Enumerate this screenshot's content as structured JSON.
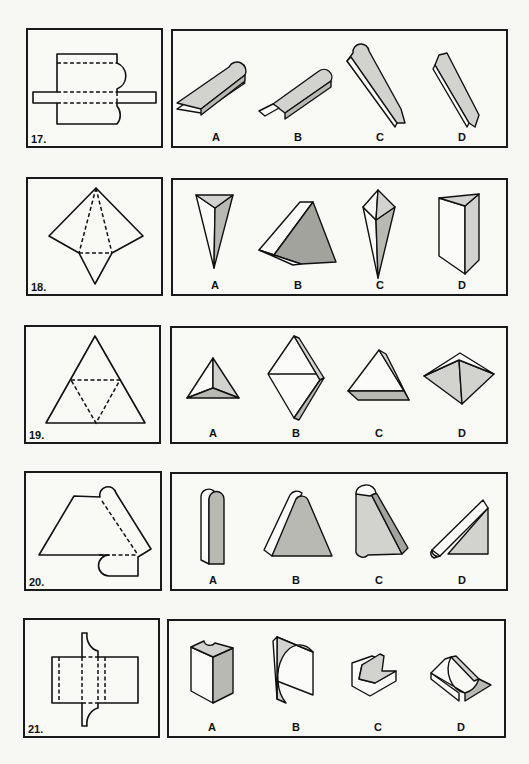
{
  "page": {
    "background": "#f7f7f4",
    "line_color": "#111111",
    "shade_light": "#d2d2ce",
    "shade_dark": "#a3a39e"
  },
  "problems": [
    {
      "number": "17.",
      "net": "rectangle with crossbar tab and two rounded lobes, dashed fold lines",
      "options": [
        {
          "label": "A",
          "shape": "flat bar with rounded end"
        },
        {
          "label": "B",
          "shape": "flat bar with rounded end and small square tab"
        },
        {
          "label": "C",
          "shape": "tall bar with rounded top and square tab at bottom"
        },
        {
          "label": "D",
          "shape": "narrow bar with notched ends"
        }
      ]
    },
    {
      "number": "18.",
      "net": "diamond net with dashed triangle fold lines",
      "options": [
        {
          "label": "A",
          "shape": "inverted triangular pyramid"
        },
        {
          "label": "B",
          "shape": "wedge pyramid"
        },
        {
          "label": "C",
          "shape": "elongated double pyramid"
        },
        {
          "label": "D",
          "shape": "triangular prism"
        }
      ]
    },
    {
      "number": "19.",
      "net": "large triangle with inner dashed triangle",
      "options": [
        {
          "label": "A",
          "shape": "tetrahedron"
        },
        {
          "label": "B",
          "shape": "rhombus slab"
        },
        {
          "label": "C",
          "shape": "triangular slab"
        },
        {
          "label": "D",
          "shape": "flat square pyramid"
        }
      ]
    },
    {
      "number": "20.",
      "net": "trapezoid with rounded strip and tab",
      "options": [
        {
          "label": "A",
          "shape": "rounded-top column"
        },
        {
          "label": "B",
          "shape": "rounded-top trapezoid block"
        },
        {
          "label": "C",
          "shape": "slanted rounded block"
        },
        {
          "label": "D",
          "shape": "right-triangle wedge with rounded edge"
        }
      ]
    },
    {
      "number": "21.",
      "net": "rectangle with concave tabs and dashed fold lines",
      "options": [
        {
          "label": "A",
          "shape": "block with notch on top"
        },
        {
          "label": "B",
          "shape": "curved-face prism"
        },
        {
          "label": "C",
          "shape": "cove-shaped block"
        },
        {
          "label": "D",
          "shape": "flared ridge block"
        }
      ]
    }
  ]
}
